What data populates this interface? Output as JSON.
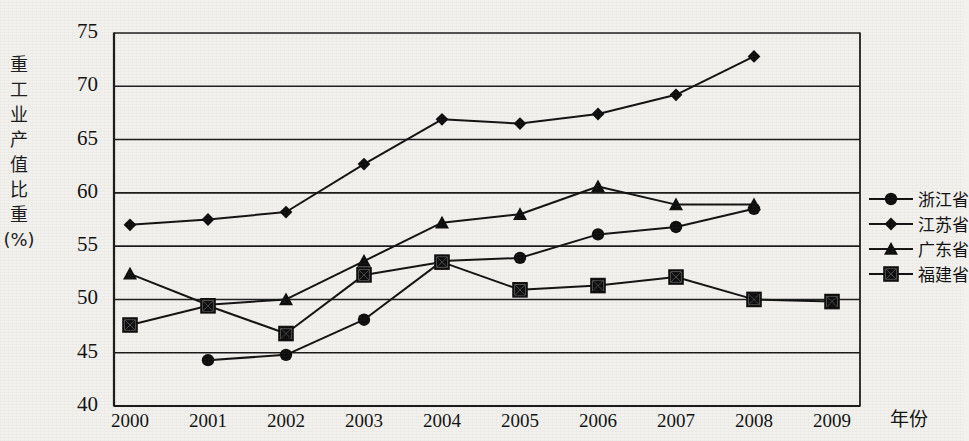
{
  "chart_data": {
    "type": "line",
    "title": "",
    "xlabel": "年份",
    "ylabel": "重工业产值比重(%)",
    "ylabel_vertical": "重\n工\n业\n产\n值\n比\n重\n(%)",
    "categories": [
      "2000",
      "2001",
      "2002",
      "2003",
      "2004",
      "2005",
      "2006",
      "2007",
      "2008",
      "2009"
    ],
    "x": [
      2000,
      2001,
      2002,
      2003,
      2004,
      2005,
      2006,
      2007,
      2008,
      2009
    ],
    "ylim": [
      40,
      75
    ],
    "yticks": [
      40,
      45,
      50,
      55,
      60,
      65,
      70,
      75
    ],
    "grid": true,
    "legend_position": "right",
    "series": [
      {
        "name": "浙江省",
        "marker": "circle",
        "color": "#000000",
        "values": [
          null,
          44.3,
          44.8,
          48.1,
          53.6,
          53.9,
          56.1,
          56.8,
          58.5,
          null
        ]
      },
      {
        "name": "江苏省",
        "marker": "diamond",
        "color": "#000000",
        "values": [
          57.0,
          57.5,
          58.2,
          62.7,
          66.9,
          66.5,
          67.4,
          69.2,
          72.8,
          null
        ]
      },
      {
        "name": "广东省",
        "marker": "triangle",
        "color": "#000000",
        "values": [
          52.4,
          49.5,
          50.0,
          53.6,
          57.2,
          58.0,
          60.6,
          58.9,
          58.9,
          null
        ]
      },
      {
        "name": "福建省",
        "marker": "crossed-square",
        "color": "#000000",
        "values": [
          47.6,
          49.4,
          46.8,
          52.3,
          53.5,
          50.9,
          51.3,
          52.1,
          50.0,
          49.8
        ]
      }
    ]
  },
  "legend": {
    "items": [
      {
        "label": "浙江省",
        "marker": "circle"
      },
      {
        "label": "江苏省",
        "marker": "diamond"
      },
      {
        "label": "广东省",
        "marker": "triangle"
      },
      {
        "label": "福建省",
        "marker": "crossed-square"
      }
    ]
  }
}
